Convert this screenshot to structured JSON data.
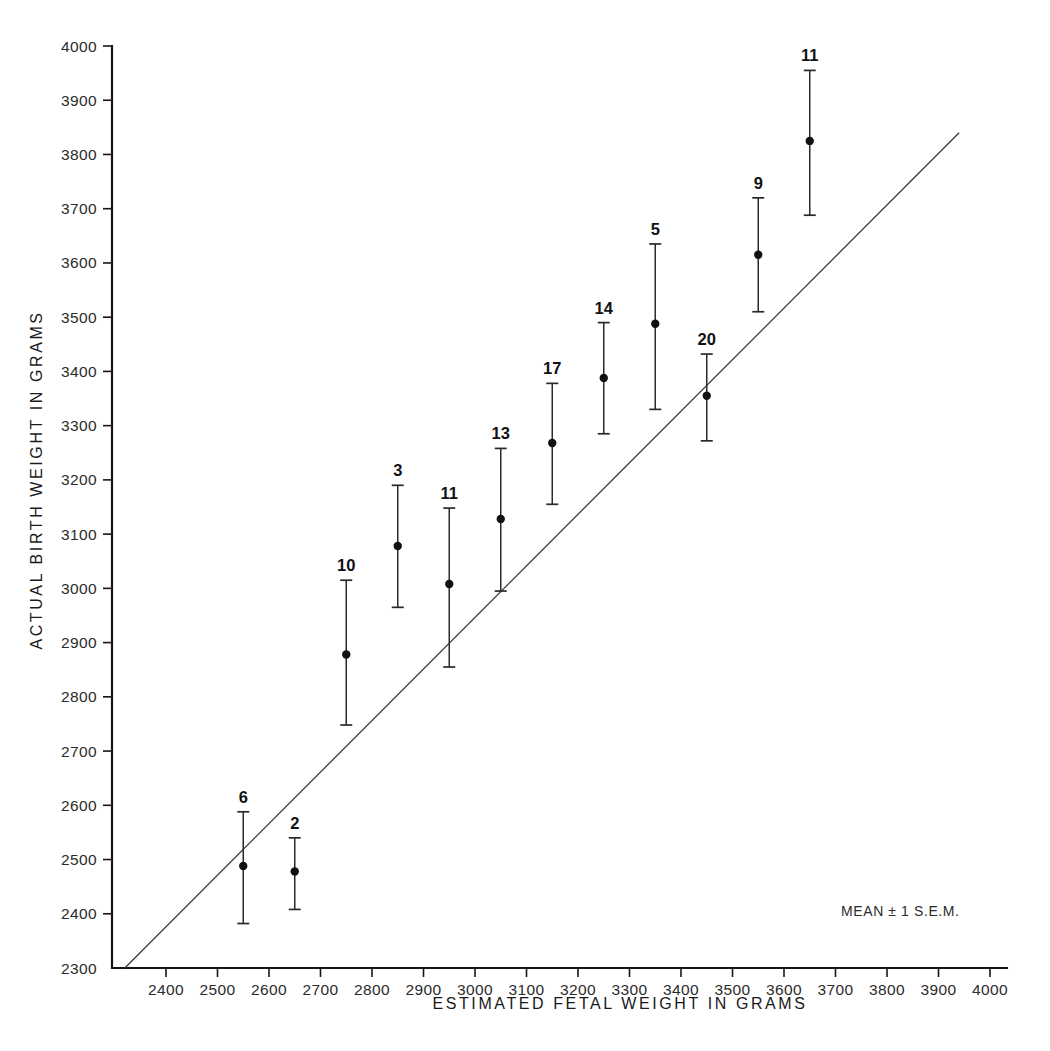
{
  "figure": {
    "background_color": "#ffffff",
    "ink_color": "#1a1a1a",
    "legend_note": "MEAN ± 1 S.E.M."
  },
  "chart_data": {
    "type": "scatter",
    "title": "",
    "subtitle": "",
    "xlabel": "ESTIMATED FETAL WEIGHT IN GRAMS",
    "ylabel": "ACTUAL BIRTH WEIGHT IN GRAMS",
    "xlim": [
      2270,
      4040
    ],
    "ylim": [
      2300,
      4030
    ],
    "grid": false,
    "legend_position": "bottom-right",
    "legend_entries": [
      "MEAN ± 1 S.E.M."
    ],
    "annotations": [
      "Numbers above each point indicate the number of cases (n) in that estimated-weight group.",
      "Diagonal line is the line of identity (actual = estimated)."
    ],
    "xticks": [
      2400,
      2500,
      2600,
      2700,
      2800,
      2900,
      3000,
      3100,
      3200,
      3300,
      3400,
      3500,
      3600,
      3700,
      3800,
      3900,
      4000
    ],
    "xtick_labels": [
      "2400",
      "2500",
      "2600",
      "2700",
      "2800",
      "2900",
      "3000",
      "3100",
      "3200",
      "3300",
      "3400",
      "3500",
      "3600",
      "3700",
      "3800",
      "3900",
      "4000"
    ],
    "yticks": [
      2300,
      2400,
      2500,
      2600,
      2700,
      2800,
      2900,
      3000,
      3100,
      3200,
      3300,
      3400,
      3500,
      3600,
      3700,
      3800,
      3900,
      4000
    ],
    "ytick_labels": [
      "2300",
      "2400",
      "2500",
      "2600",
      "2700",
      "2800",
      "2900",
      "3000",
      "3100",
      "3200",
      "3300",
      "3400",
      "3500",
      "3600",
      "3700",
      "3800",
      "3900",
      "4000"
    ],
    "identity_line": {
      "label": "line of identity",
      "x": [
        2320,
        3940
      ],
      "y": [
        2300,
        3840
      ]
    },
    "error_bar_type": "1 S.E.M.",
    "point_label_key": "n",
    "points": [
      {
        "n": 6,
        "x": 2550,
        "y": 2488,
        "upper": 2588,
        "lower": 2382
      },
      {
        "n": 2,
        "x": 2650,
        "y": 2478,
        "upper": 2540,
        "lower": 2408
      },
      {
        "n": 10,
        "x": 2750,
        "y": 2878,
        "upper": 3015,
        "lower": 2748
      },
      {
        "n": 3,
        "x": 2850,
        "y": 3078,
        "upper": 3190,
        "lower": 2965
      },
      {
        "n": 11,
        "x": 2950,
        "y": 3008,
        "upper": 3148,
        "lower": 2855
      },
      {
        "n": 13,
        "x": 3050,
        "y": 3128,
        "upper": 3258,
        "lower": 2995
      },
      {
        "n": 17,
        "x": 3150,
        "y": 3268,
        "upper": 3378,
        "lower": 3155
      },
      {
        "n": 14,
        "x": 3250,
        "y": 3388,
        "upper": 3490,
        "lower": 3285
      },
      {
        "n": 5,
        "x": 3350,
        "y": 3488,
        "upper": 3635,
        "lower": 3330
      },
      {
        "n": 20,
        "x": 3450,
        "y": 3355,
        "upper": 3432,
        "lower": 3272
      },
      {
        "n": 9,
        "x": 3550,
        "y": 3615,
        "upper": 3720,
        "lower": 3510
      },
      {
        "n": 11,
        "x": 3650,
        "y": 3825,
        "upper": 3955,
        "lower": 3688
      }
    ]
  }
}
